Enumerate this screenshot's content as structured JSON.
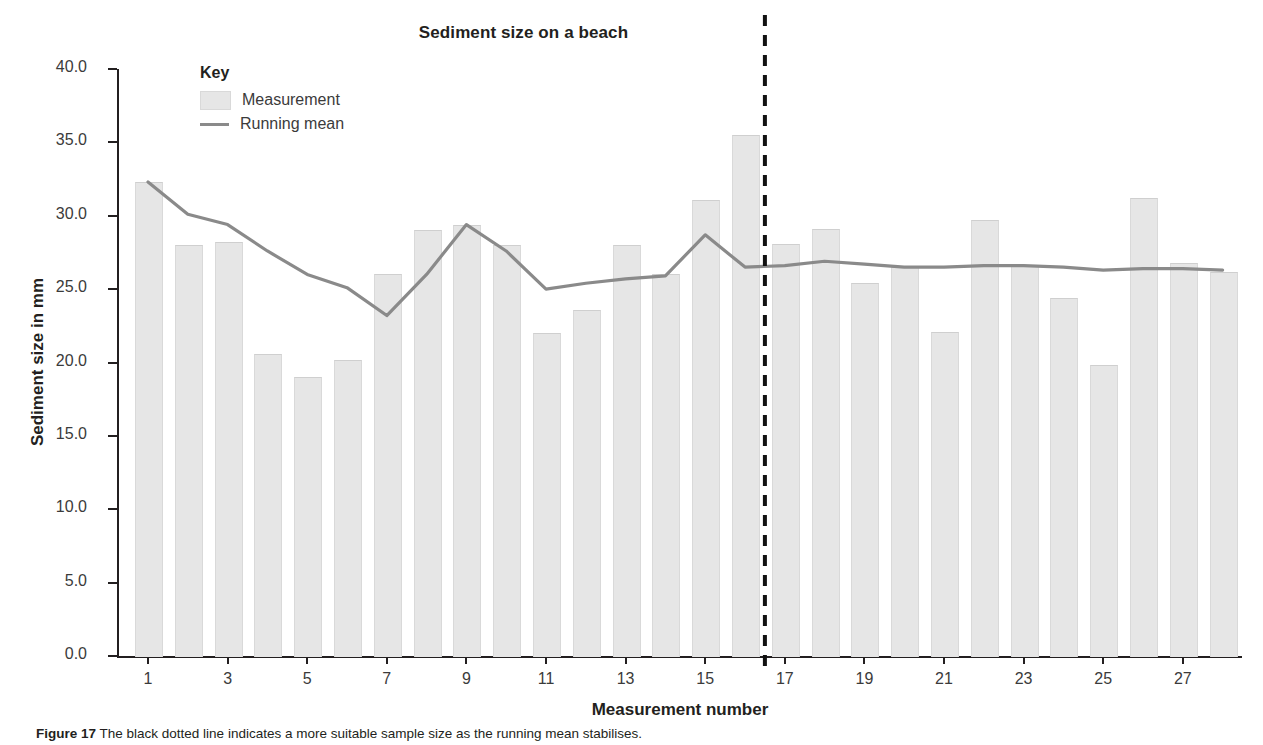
{
  "chart_data": {
    "type": "bar",
    "title": "Sediment size on a beach",
    "xlabel": "Measurement number",
    "ylabel": "Sediment size in mm",
    "ylim": [
      0.0,
      40.0
    ],
    "ytick_step": 5.0,
    "ytick_labels": [
      "0.0",
      "5.0",
      "10.0",
      "15.0",
      "20.0",
      "25.0",
      "30.0",
      "35.0",
      "40.0"
    ],
    "ytick_values": [
      0.0,
      5.0,
      10.0,
      15.0,
      20.0,
      25.0,
      30.0,
      35.0,
      40.0
    ],
    "xtick_labels": [
      "1",
      "3",
      "5",
      "7",
      "9",
      "11",
      "13",
      "15",
      "17",
      "19",
      "21",
      "23",
      "25",
      "27"
    ],
    "xtick_values": [
      1,
      3,
      5,
      7,
      9,
      11,
      13,
      15,
      17,
      19,
      21,
      23,
      25,
      27
    ],
    "grid": false,
    "legend_position": "top-left",
    "categories": [
      1,
      2,
      3,
      4,
      5,
      6,
      7,
      8,
      9,
      10,
      11,
      12,
      13,
      14,
      15,
      16,
      17,
      18,
      19,
      20,
      21,
      22,
      23,
      24,
      25,
      26,
      27,
      28
    ],
    "series": [
      {
        "name": "Measurement",
        "type": "bar",
        "color": "#e6e6e6",
        "values": [
          32.3,
          28.0,
          28.2,
          20.6,
          19.0,
          20.2,
          26.0,
          29.0,
          29.4,
          28.0,
          22.0,
          23.6,
          28.0,
          26.0,
          31.1,
          35.5,
          28.1,
          29.1,
          25.4,
          26.5,
          22.1,
          29.7,
          26.6,
          24.4,
          19.8,
          31.2,
          26.8,
          26.2
        ]
      },
      {
        "name": "Running mean",
        "type": "line",
        "color": "#8a8a8a",
        "values": [
          32.3,
          30.1,
          29.4,
          27.6,
          26.0,
          25.1,
          23.2,
          26.0,
          29.4,
          27.6,
          25.0,
          25.4,
          25.7,
          25.9,
          28.7,
          26.5,
          26.6,
          26.9,
          26.7,
          26.5,
          26.5,
          26.6,
          26.6,
          26.5,
          26.3,
          26.4,
          26.4,
          26.3
        ]
      }
    ],
    "annotations": [
      {
        "name": "divider-line",
        "type": "vertical-dashed-line",
        "x": 16.5,
        "color": "#111111"
      }
    ]
  },
  "legend": {
    "title": "Key",
    "items": [
      {
        "label": "Measurement",
        "marker": "swatch"
      },
      {
        "label": "Running mean",
        "marker": "line"
      }
    ]
  },
  "caption": {
    "figure_label": "Figure 17",
    "text": "The black dotted line indicates a more suitable sample size as the running mean stabilises."
  }
}
